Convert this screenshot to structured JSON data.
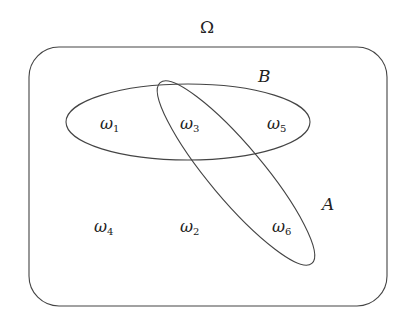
{
  "diagram": {
    "type": "venn",
    "universe_label": "Ω",
    "sets": [
      {
        "name": "B",
        "label": "B",
        "elements": [
          "ω1",
          "ω3",
          "ω5"
        ]
      },
      {
        "name": "A",
        "label": "A",
        "elements": [
          "ω3",
          "ω6"
        ]
      }
    ],
    "outcomes": [
      {
        "id": "w1",
        "base": "ω",
        "sub": "1"
      },
      {
        "id": "w2",
        "base": "ω",
        "sub": "2"
      },
      {
        "id": "w3",
        "base": "ω",
        "sub": "3"
      },
      {
        "id": "w4",
        "base": "ω",
        "sub": "4"
      },
      {
        "id": "w5",
        "base": "ω",
        "sub": "5"
      },
      {
        "id": "w6",
        "base": "ω",
        "sub": "6"
      }
    ],
    "stroke_color": "#444444",
    "background": "#ffffff"
  }
}
